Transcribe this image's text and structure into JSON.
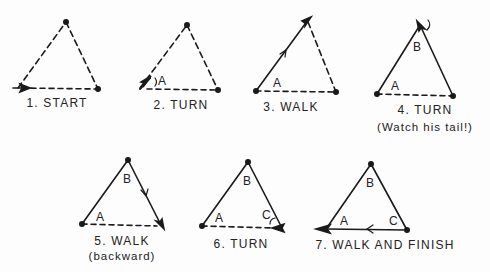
{
  "figure": {
    "panels": [
      {
        "step": 1,
        "caption": "1. START",
        "subcaption": "",
        "action": "start",
        "vertex_labels": []
      },
      {
        "step": 2,
        "caption": "2. TURN",
        "subcaption": "",
        "action": "turn",
        "vertex_labels": [
          "A"
        ]
      },
      {
        "step": 3,
        "caption": "3. WALK",
        "subcaption": "",
        "action": "walk",
        "vertex_labels": [
          "A"
        ]
      },
      {
        "step": 4,
        "caption": "4. TURN",
        "subcaption": "(Watch his tail!)",
        "action": "turn",
        "vertex_labels": [
          "A",
          "B"
        ]
      },
      {
        "step": 5,
        "caption": "5. WALK",
        "subcaption": "(backward)",
        "action": "walk-backward",
        "vertex_labels": [
          "A",
          "B"
        ]
      },
      {
        "step": 6,
        "caption": "6. TURN",
        "subcaption": "",
        "action": "turn",
        "vertex_labels": [
          "A",
          "B",
          "C"
        ]
      },
      {
        "step": 7,
        "caption": "7. WALK AND FINISH",
        "subcaption": "",
        "action": "walk-finish",
        "vertex_labels": [
          "A",
          "B",
          "C"
        ]
      }
    ],
    "labels": {
      "A": "A",
      "B": "B",
      "C": "C"
    },
    "colors": {
      "ink": "#1a1a1a",
      "background": "#fdfdfd"
    }
  }
}
